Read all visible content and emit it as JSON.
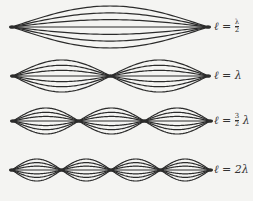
{
  "diagram": {
    "stroke_color": "#2b2b2b",
    "rows": [
      {
        "label_var": "ℓ =",
        "label_num": "λ",
        "label_den": "2",
        "label_suffix": "",
        "cy": 27,
        "amp": 21,
        "x0": 12,
        "x1": 208,
        "loops": 1
      },
      {
        "label_var": "ℓ = λ",
        "label_num": "",
        "label_den": "",
        "label_suffix": "",
        "cy": 76,
        "amp": 16,
        "x0": 13,
        "x1": 208,
        "loops": 2
      },
      {
        "label_var": "ℓ =",
        "label_num": "3",
        "label_den": "2",
        "label_suffix": "λ",
        "cy": 121,
        "amp": 13,
        "x0": 13,
        "x1": 210,
        "loops": 3
      },
      {
        "label_var": "ℓ = 2λ",
        "label_num": "",
        "label_den": "",
        "label_suffix": "",
        "cy": 170,
        "amp": 11,
        "x0": 12,
        "x1": 210,
        "loops": 4
      }
    ]
  }
}
